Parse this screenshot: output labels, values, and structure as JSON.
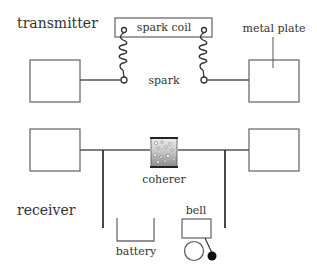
{
  "diagram": {
    "sections": {
      "transmitter": {
        "label": "transmitter"
      },
      "receiver": {
        "label": "receiver"
      }
    },
    "labels": {
      "spark_coil": "spark coil",
      "spark": "spark",
      "metal_plate": "metal plate",
      "coherer": "coherer",
      "battery": "battery",
      "bell": "bell"
    },
    "colors": {
      "line": "#555555",
      "text": "#333333",
      "box_stroke": "#6d6d6d",
      "coherer_fill_top": "#e8e8e8",
      "coherer_fill_bottom": "#8a8a8a",
      "bell_clapper": "#111111"
    }
  }
}
